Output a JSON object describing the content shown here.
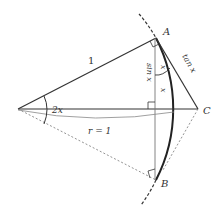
{
  "diagram": {
    "points": {
      "A": "A",
      "B": "B",
      "C": "C"
    },
    "labels": {
      "side_oa": "1",
      "angle": "2x",
      "radius": "r = 1",
      "sin": "sin x",
      "arc_x": "x",
      "half_arc": "x",
      "tan": "tan x"
    },
    "colors": {
      "line": "#333333",
      "thin_line": "#888888",
      "dashed": "#777777",
      "background": "#ffffff"
    }
  }
}
